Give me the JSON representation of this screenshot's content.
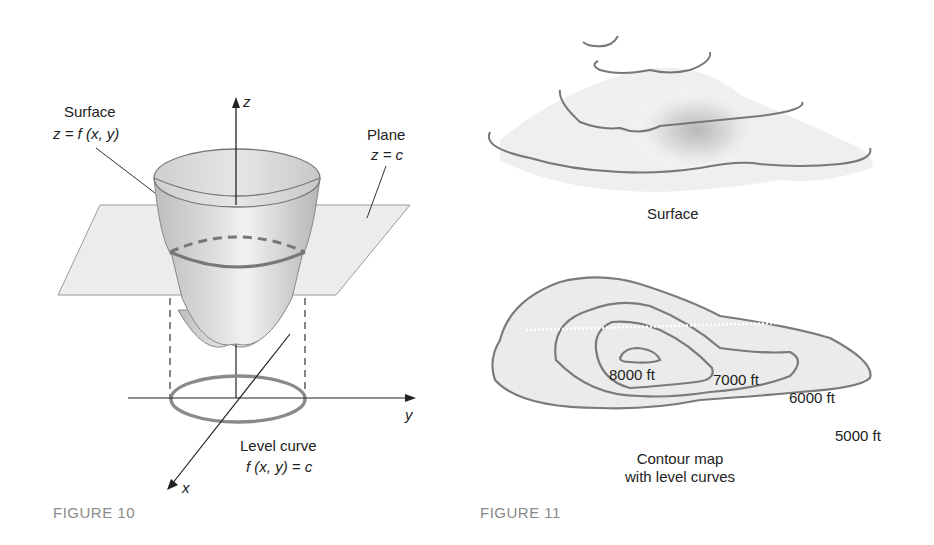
{
  "figure10": {
    "caption": "FIGURE 10",
    "surface_label": "Surface",
    "surface_eq": "z = f (x, y)",
    "plane_label": "Plane",
    "plane_eq": "z = c",
    "level_curve_label": "Level curve",
    "level_curve_eq": "f (x, y) = c",
    "axis_z": "z",
    "axis_y": "y",
    "axis_x": "x"
  },
  "figure11": {
    "caption": "FIGURE 11",
    "surface_label": "Surface",
    "contour_label_line1": "Contour map",
    "contour_label_line2": "with level curves",
    "levels": [
      "8000 ft",
      "7000 ft",
      "6000 ft",
      "5000 ft"
    ]
  },
  "colors": {
    "curve": "#7a7a7a",
    "fill": "#e4e4e4",
    "plane": "#ececec",
    "caption": "#8a8a8a"
  }
}
